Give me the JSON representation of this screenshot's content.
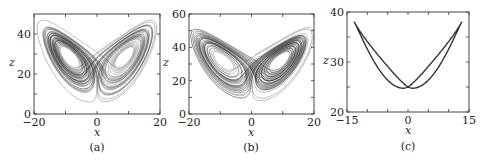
{
  "figure": {
    "panels": [
      {
        "caption": "(a)",
        "xlabel": "x",
        "ylabel": "z"
      },
      {
        "caption": "(b)",
        "xlabel": "x",
        "ylabel": "z"
      },
      {
        "caption": "(c)",
        "xlabel": "x",
        "ylabel": "z"
      }
    ]
  },
  "chart_data": [
    {
      "type": "line",
      "title": "(a)",
      "description": "Chaotic Lorenz-type attractor projected on x-z plane (butterfly shape, dense trajectory)",
      "xlabel": "x",
      "ylabel": "z",
      "xlim": [
        -20,
        20
      ],
      "ylim": [
        0,
        50
      ],
      "xticks": [
        -20,
        0,
        20
      ],
      "yticks": [
        0,
        20,
        40
      ],
      "minor_xticks": [
        -10,
        10
      ],
      "minor_yticks": [
        10,
        30
      ],
      "grid": false,
      "features": {
        "left_lobe_peak": [
          -15,
          43
        ],
        "right_lobe_peak": [
          18,
          47
        ],
        "bottom_min_z": 6,
        "center_crossing": [
          0,
          25
        ],
        "left_hole_center": [
          -8,
          27
        ],
        "right_hole_center": [
          9,
          30
        ]
      },
      "sim": {
        "sigma": 10,
        "rho": 28,
        "beta": 2.6667,
        "steps": 9000,
        "dt": 0.006
      }
    },
    {
      "type": "line",
      "title": "(b)",
      "description": "Chaotic Lorenz-type attractor projected on x-z plane (broader butterfly, dense trajectory)",
      "xlabel": "x",
      "ylabel": "z",
      "xlim": [
        -20,
        20
      ],
      "ylim": [
        0,
        60
      ],
      "xticks": [
        -20,
        0,
        20
      ],
      "yticks": [
        0,
        20,
        40,
        60
      ],
      "minor_xticks": [
        -10,
        10
      ],
      "minor_yticks": [
        10,
        30,
        50
      ],
      "grid": false,
      "features": {
        "left_lobe_peak": [
          -19,
          52
        ],
        "right_lobe_peak": [
          17,
          49
        ],
        "bottom_min_z": 8,
        "center_crossing": [
          0,
          30
        ],
        "left_hole_center": [
          -9,
          26
        ],
        "right_hole_center": [
          9,
          28
        ]
      },
      "sim": {
        "sigma": 10,
        "rho": 32,
        "beta": 2.6667,
        "steps": 9000,
        "dt": 0.006
      }
    },
    {
      "type": "line",
      "title": "(c)",
      "description": "Periodic figure-eight limit cycle in x-z plane",
      "xlabel": "x",
      "ylabel": "z",
      "xlim": [
        -15,
        15
      ],
      "ylim": [
        20,
        40
      ],
      "xticks": [
        -15,
        0,
        15
      ],
      "yticks": [
        20,
        30,
        40
      ],
      "minor_xticks": [
        -10,
        -5,
        5,
        10
      ],
      "minor_yticks": [
        25,
        35
      ],
      "grid": false,
      "features": {
        "left_peak": [
          -13.5,
          38
        ],
        "right_peak": [
          12.5,
          38
        ],
        "left_min": [
          -5,
          22.5
        ],
        "right_min": [
          5.5,
          22.5
        ],
        "crossing": [
          0,
          25
        ]
      },
      "curve": {
        "amp_x": 13,
        "z_center": 30,
        "amp_z": 8
      }
    }
  ]
}
